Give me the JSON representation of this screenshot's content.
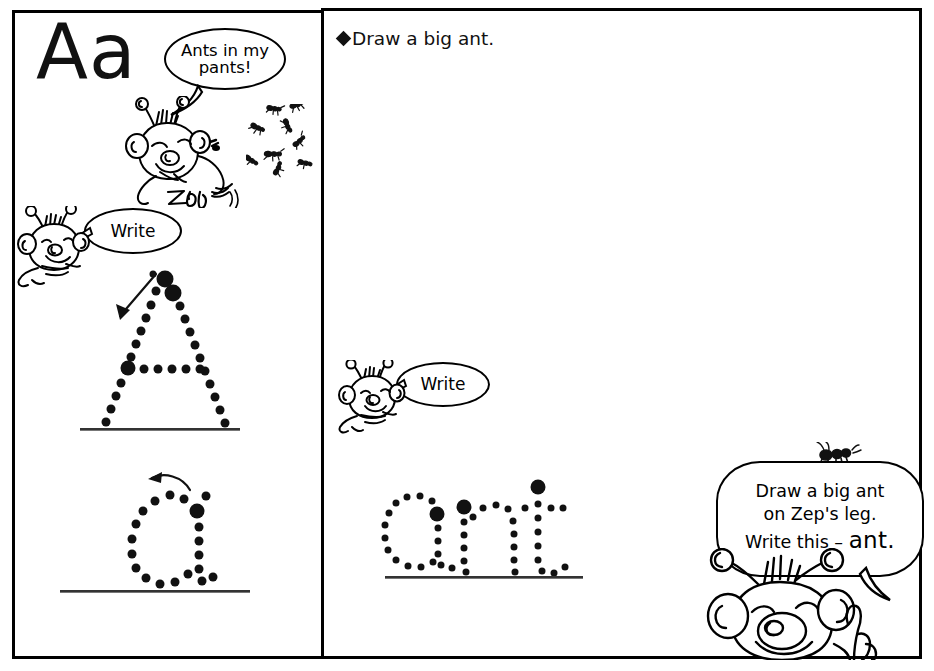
{
  "worksheet": {
    "title_letters": "Aa",
    "left_panel": {
      "bubble_ants": {
        "line1": "Ants in my",
        "line2": "pants!"
      },
      "character_signature": "Zep",
      "bubble_write": "Write",
      "trace_uppercase": "A",
      "trace_lowercase": "a",
      "ant_count": 9
    },
    "right_panel": {
      "instruction": {
        "bullet": "diamond-bullet-icon",
        "text": "Draw a big ant."
      },
      "bubble_write": "Write",
      "trace_word": "ant",
      "zep_bubble": {
        "line1": "Draw a big ant",
        "line2": "on Zep's leg.",
        "line3_prefix": "Write this – ",
        "line3_word": "ant."
      }
    }
  },
  "colors": {
    "ink": "#111111",
    "paper": "#ffffff",
    "rule_line": "#333333"
  }
}
